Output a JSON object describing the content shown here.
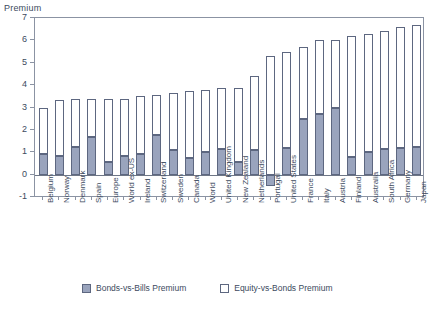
{
  "chart_data": {
    "type": "bar",
    "title": "",
    "subtype": "stacked-bar",
    "ylabel": "Premium",
    "xlabel": "",
    "ylim": [
      -1,
      7
    ],
    "yticks": [
      -1,
      0,
      1,
      2,
      3,
      4,
      5,
      6,
      7
    ],
    "ytick_labels": [
      "-1",
      "0",
      "1",
      "2",
      "3",
      "4",
      "5",
      "6",
      "7"
    ],
    "grid": false,
    "legend_position": "bottom",
    "categories": [
      "Belgium",
      "Norway",
      "Denmark",
      "Spain",
      "Europe",
      "World ex-US",
      "Ireland",
      "Switzerland",
      "Sweden",
      "Canada",
      "World",
      "United Kingdom",
      "New Zealand",
      "Netherlands",
      "Portugal",
      "United States",
      "France",
      "Italy",
      "Austria",
      "Finland",
      "Australia",
      "South Africa",
      "Germany",
      "Japan"
    ],
    "series": [
      {
        "name": "Bonds-vs-Bills Premium",
        "color": "#9aa4bd",
        "values": [
          0.9,
          0.85,
          1.25,
          1.7,
          0.55,
          0.85,
          0.9,
          1.75,
          1.1,
          0.75,
          1.0,
          1.15,
          0.55,
          1.1,
          -0.5,
          1.2,
          2.5,
          2.7,
          3.0,
          0.8,
          1.0,
          1.15,
          1.2,
          1.25
        ]
      },
      {
        "name": "Equity-vs-Bonds Premium",
        "color": "#ffffff",
        "values": [
          2.1,
          2.5,
          2.15,
          1.7,
          2.85,
          2.55,
          2.6,
          1.8,
          2.55,
          3.0,
          2.8,
          2.7,
          3.3,
          3.3,
          5.3,
          4.3,
          3.2,
          3.3,
          3.0,
          5.4,
          5.3,
          5.25,
          5.4,
          5.45
        ]
      }
    ],
    "totals": [
      3.0,
      3.35,
      3.4,
      3.4,
      3.4,
      3.4,
      3.5,
      3.55,
      3.65,
      3.75,
      3.8,
      3.85,
      3.85,
      4.4,
      4.8,
      5.5,
      5.7,
      6.0,
      6.0,
      6.2,
      6.3,
      6.4,
      6.6,
      6.7
    ]
  },
  "legend": {
    "items": [
      {
        "label": "Bonds-vs-Bills Premium",
        "swatch": "fill"
      },
      {
        "label": "Equity-vs-Bonds Premium",
        "swatch": "open"
      }
    ]
  },
  "axis": {
    "y_title": "Premium"
  }
}
